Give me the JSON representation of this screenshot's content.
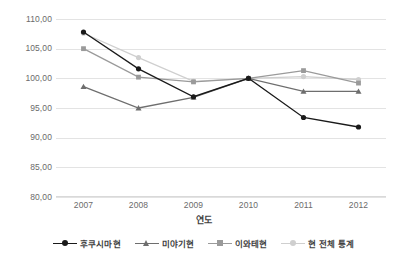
{
  "chart_data": {
    "type": "line",
    "title": "",
    "xlabel": "연도",
    "ylabel": "",
    "categories": [
      "2007",
      "2008",
      "2009",
      "2010",
      "2011",
      "2012"
    ],
    "ylim": [
      80,
      110
    ],
    "ytick_step": 5,
    "ytick_labels": [
      "110,00",
      "105,00",
      "100,00",
      "95,00",
      "90,00",
      "85,00",
      "80,00"
    ],
    "ytick_values": [
      110,
      105,
      100,
      95,
      90,
      85,
      80
    ],
    "grid": true,
    "legend_position": "bottom",
    "series": [
      {
        "name": "후쿠시마현",
        "color": "#1a1a1a",
        "marker": "circle",
        "values": [
          107.8,
          101.6,
          96.9,
          100.0,
          93.4,
          91.8
        ]
      },
      {
        "name": "미야기현",
        "color": "#6e6e6e",
        "marker": "triangle",
        "values": [
          98.6,
          95.0,
          96.8,
          100.0,
          97.8,
          97.8
        ]
      },
      {
        "name": "이와테현",
        "color": "#9a9a9a",
        "marker": "square",
        "values": [
          105.0,
          100.2,
          99.4,
          100.0,
          101.3,
          99.2
        ]
      },
      {
        "name": "현 전체 통계",
        "color": "#cfcfcf",
        "marker": "circle",
        "values": [
          107.6,
          103.5,
          99.5,
          100.0,
          100.3,
          99.8
        ]
      }
    ]
  },
  "axis": {
    "x_title": "연도"
  },
  "legend": {
    "items": [
      {
        "label": "후쿠시마현"
      },
      {
        "label": "미야기현"
      },
      {
        "label": "이와테현"
      },
      {
        "label": "현 전체 통계"
      }
    ]
  }
}
